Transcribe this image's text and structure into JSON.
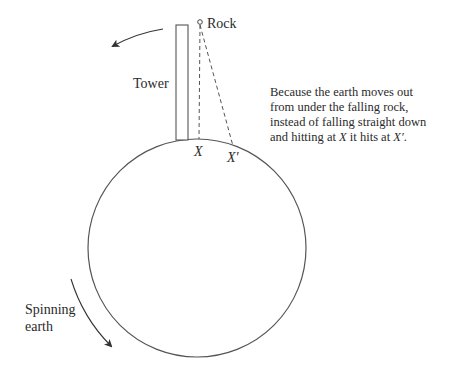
{
  "labels": {
    "rock": "Rock",
    "tower": "Tower",
    "x": "X",
    "x_prime": "X′",
    "spinning_line1": "Spinning",
    "spinning_line2": "earth"
  },
  "caption": {
    "line1": "Because the earth moves out",
    "line2": "from under the falling rock,",
    "line3": "instead of falling straight down",
    "line4_pre": "and hitting at ",
    "line4_x": "X",
    "line4_mid": " it hits at ",
    "line4_xp": "X′",
    "line4_end": "."
  },
  "colors": {
    "stroke": "#555555",
    "text": "#2a2a2a"
  }
}
